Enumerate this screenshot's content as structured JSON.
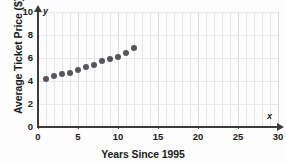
{
  "chart_data": {
    "type": "scatter",
    "title": "",
    "xlabel": "Years Since 1995",
    "ylabel": "Average Ticket Price ($)",
    "xlim": [
      0,
      30
    ],
    "ylim": [
      0,
      10
    ],
    "xticks": [
      0,
      5,
      10,
      15,
      20,
      25,
      30
    ],
    "yticks": [
      0,
      2,
      4,
      6,
      8,
      10
    ],
    "grid": "vertical minor gridlines every 1 unit, horizontal gridlines every 2 units",
    "legend": "none",
    "axis_letters": {
      "x": "x",
      "y": "y"
    },
    "x": [
      1,
      2,
      3,
      4,
      5,
      6,
      7,
      8,
      9,
      10,
      11,
      12
    ],
    "values": [
      4.2,
      4.4,
      4.6,
      4.7,
      5.0,
      5.2,
      5.4,
      5.7,
      5.9,
      6.1,
      6.4,
      6.9
    ],
    "points": [
      {
        "x": 1,
        "y": 4.2
      },
      {
        "x": 2,
        "y": 4.4
      },
      {
        "x": 3,
        "y": 4.6
      },
      {
        "x": 4,
        "y": 4.7
      },
      {
        "x": 5,
        "y": 5.0
      },
      {
        "x": 6,
        "y": 5.2
      },
      {
        "x": 7,
        "y": 5.4
      },
      {
        "x": 8,
        "y": 5.7
      },
      {
        "x": 9,
        "y": 5.9
      },
      {
        "x": 10,
        "y": 6.1
      },
      {
        "x": 11,
        "y": 6.4
      },
      {
        "x": 12,
        "y": 6.9
      }
    ],
    "marker_color": "#55565c",
    "axis_color": "#3b3b3b",
    "grid_color": "#e2e4ea"
  }
}
